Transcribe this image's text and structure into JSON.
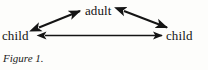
{
  "figure": {
    "caption": "Figure 1.",
    "background_color": "#fdfdfb",
    "ink_color": "#141414",
    "nodes": {
      "adult": "adult",
      "child_left": "child",
      "child_right": "child"
    },
    "edges": [
      {
        "id": "child-left-to-adult",
        "from": "child_left",
        "to": "adult",
        "style": "double-headed-arrow"
      },
      {
        "id": "adult-to-child-right",
        "from": "adult",
        "to": "child_right",
        "style": "double-headed-arrow"
      },
      {
        "id": "child-left-to-child-right",
        "from": "child_left",
        "to": "child_right",
        "style": "double-headed-arrow"
      }
    ]
  }
}
